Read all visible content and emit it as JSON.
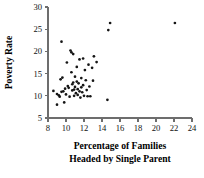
{
  "chart_data": {
    "type": "scatter",
    "title": "",
    "xlabel": "Percentage of Families Headed by Single Parent",
    "xlabel_line1": "Percentage of Families",
    "xlabel_line2": "Headed by Single Parent",
    "ylabel": "Poverty Rate",
    "xlim": [
      8,
      24
    ],
    "ylim": [
      5,
      30
    ],
    "xticks": [
      8,
      10,
      12,
      14,
      16,
      18,
      20,
      22,
      24
    ],
    "yticks": [
      5,
      10,
      15,
      20,
      25,
      30
    ],
    "xtick_labels": [
      "8",
      "10",
      "12",
      "14",
      "16",
      "18",
      "20",
      "22",
      "24"
    ],
    "ytick_labels": [
      "5",
      "10",
      "15",
      "20",
      "25",
      "30"
    ],
    "grid": false,
    "legend": false,
    "marker_color": "#151515",
    "axis_color": "#6d6d6d",
    "points": [
      {
        "x": 8.6,
        "y": 11.1
      },
      {
        "x": 9.0,
        "y": 10.4
      },
      {
        "x": 9.0,
        "y": 8.0
      },
      {
        "x": 9.2,
        "y": 10.1
      },
      {
        "x": 9.3,
        "y": 9.8
      },
      {
        "x": 9.4,
        "y": 13.7
      },
      {
        "x": 9.5,
        "y": 22.2
      },
      {
        "x": 9.5,
        "y": 10.9
      },
      {
        "x": 9.6,
        "y": 14.1
      },
      {
        "x": 9.7,
        "y": 11.0
      },
      {
        "x": 9.8,
        "y": 8.5
      },
      {
        "x": 9.9,
        "y": 11.6
      },
      {
        "x": 10.0,
        "y": 10.3
      },
      {
        "x": 10.1,
        "y": 17.5
      },
      {
        "x": 10.2,
        "y": 12.2
      },
      {
        "x": 10.3,
        "y": 11.8
      },
      {
        "x": 10.4,
        "y": 9.8
      },
      {
        "x": 10.5,
        "y": 20.2
      },
      {
        "x": 10.6,
        "y": 19.8
      },
      {
        "x": 10.6,
        "y": 15.3
      },
      {
        "x": 10.7,
        "y": 12.6
      },
      {
        "x": 10.7,
        "y": 11.2
      },
      {
        "x": 10.8,
        "y": 19.4
      },
      {
        "x": 10.8,
        "y": 13.0
      },
      {
        "x": 10.9,
        "y": 11.4
      },
      {
        "x": 10.9,
        "y": 10.0
      },
      {
        "x": 11.0,
        "y": 14.3
      },
      {
        "x": 11.0,
        "y": 12.0
      },
      {
        "x": 11.1,
        "y": 10.6
      },
      {
        "x": 11.2,
        "y": 16.5
      },
      {
        "x": 11.2,
        "y": 13.2
      },
      {
        "x": 11.3,
        "y": 11.5
      },
      {
        "x": 11.3,
        "y": 10.2
      },
      {
        "x": 11.4,
        "y": 12.8
      },
      {
        "x": 11.5,
        "y": 18.2
      },
      {
        "x": 11.5,
        "y": 11.0
      },
      {
        "x": 11.6,
        "y": 9.6
      },
      {
        "x": 11.7,
        "y": 14.0
      },
      {
        "x": 11.7,
        "y": 11.9
      },
      {
        "x": 11.8,
        "y": 10.8
      },
      {
        "x": 11.9,
        "y": 18.4
      },
      {
        "x": 11.9,
        "y": 12.4
      },
      {
        "x": 12.0,
        "y": 10.0
      },
      {
        "x": 12.1,
        "y": 15.8
      },
      {
        "x": 12.2,
        "y": 13.5
      },
      {
        "x": 12.3,
        "y": 11.3
      },
      {
        "x": 12.4,
        "y": 9.9
      },
      {
        "x": 12.5,
        "y": 17.0
      },
      {
        "x": 12.6,
        "y": 12.1
      },
      {
        "x": 12.7,
        "y": 9.9
      },
      {
        "x": 12.9,
        "y": 16.3
      },
      {
        "x": 13.0,
        "y": 13.4
      },
      {
        "x": 13.1,
        "y": 18.9
      },
      {
        "x": 13.4,
        "y": 17.6
      },
      {
        "x": 14.6,
        "y": 9.1
      },
      {
        "x": 14.7,
        "y": 24.8
      },
      {
        "x": 14.9,
        "y": 26.4
      },
      {
        "x": 22.1,
        "y": 26.4
      }
    ]
  }
}
